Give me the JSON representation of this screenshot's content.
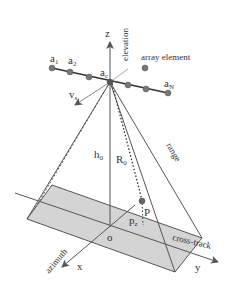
{
  "diagram": {
    "labels": {
      "z_axis": "z",
      "elevation": "elevation",
      "array_element": "array element",
      "a1_main": "a",
      "a1_sub": "1",
      "a2_main": "a",
      "a2_sub": "2",
      "ac_main": "a",
      "ac_sub": "c",
      "aN_main": "a",
      "aN_sub": "N",
      "vs_main": "v",
      "vs_sub": "s",
      "h0_main": "h",
      "h0_sub": "0",
      "R0_main": "R",
      "R0_sub": "0",
      "range": "range",
      "P": "P",
      "pz_main": "p",
      "pz_sub": "z",
      "origin": "o",
      "cross_track": "cross-track",
      "azimuth": "azimuth",
      "x_axis": "x",
      "y_axis": "y"
    },
    "colors": {
      "line": "#555555",
      "dark_line": "#333333",
      "ground_fill": "#d4d4d4",
      "dot": "#777777",
      "light_line": "#aaaaaa",
      "text": "#333333"
    }
  }
}
